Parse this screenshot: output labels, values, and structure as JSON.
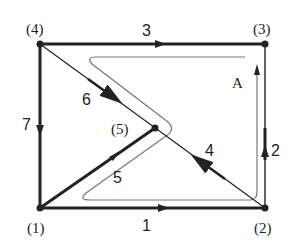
{
  "diagram": {
    "type": "directed-graph-with-loop",
    "colors": {
      "stroke": "#222222",
      "loop": "#777777",
      "background": "#ffffff"
    },
    "nodes": [
      {
        "id": "1",
        "label": "(1)",
        "x": 40,
        "y": 208
      },
      {
        "id": "2",
        "label": "(2)",
        "x": 265,
        "y": 208
      },
      {
        "id": "3",
        "label": "(3)",
        "x": 265,
        "y": 44
      },
      {
        "id": "4",
        "label": "(4)",
        "x": 40,
        "y": 44
      },
      {
        "id": "5",
        "label": "(5)",
        "x": 155,
        "y": 128
      }
    ],
    "edges": [
      {
        "id": "1",
        "label": "1",
        "from": "1",
        "to": "2"
      },
      {
        "id": "2",
        "label": "2",
        "from": "2",
        "to": "3"
      },
      {
        "id": "3",
        "label": "3",
        "from": "4",
        "to": "3"
      },
      {
        "id": "4",
        "label": "4",
        "from": "2",
        "to": "5"
      },
      {
        "id": "5",
        "label": "5",
        "from": "1",
        "to": "5"
      },
      {
        "id": "6",
        "label": "6",
        "from": "4",
        "to": "5"
      },
      {
        "id": "7",
        "label": "7",
        "from": "4",
        "to": "1"
      }
    ],
    "loop": {
      "label": "A"
    }
  }
}
